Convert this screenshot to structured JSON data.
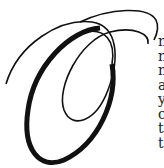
{
  "dropcap": {
    "letter": "O",
    "color": "#111111"
  },
  "body_lines": [
    "n",
    "n",
    "n",
    "a",
    "y",
    "c",
    "t",
    "t"
  ]
}
